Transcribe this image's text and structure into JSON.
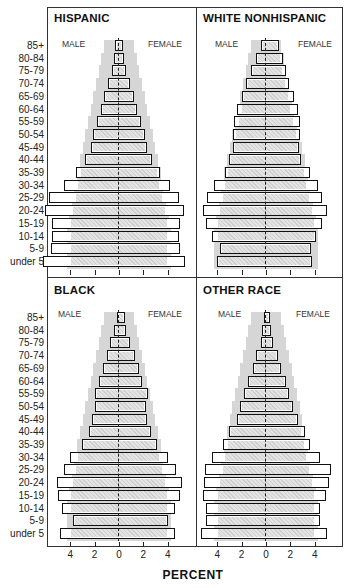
{
  "chart_data": [
    {
      "type": "bar",
      "subtype": "population-pyramid",
      "title": "HISPANIC",
      "categories": [
        "85+",
        "80-84",
        "75-79",
        "70-74",
        "65-69",
        "60-64",
        "55-59",
        "50-54",
        "45-49",
        "40-44",
        "35-39",
        "30-34",
        "25-29",
        "20-24",
        "15-19",
        "10-14",
        "5-9",
        "under 5"
      ],
      "series": [
        {
          "name": "MALE",
          "values": [
            0.3,
            0.4,
            0.6,
            0.9,
            1.2,
            1.5,
            1.8,
            2.1,
            2.3,
            2.8,
            3.5,
            4.5,
            5.7,
            6.1,
            5.5,
            5.5,
            5.6,
            6.2
          ]
        },
        {
          "name": "FEMALE",
          "values": [
            0.3,
            0.4,
            0.6,
            0.9,
            1.2,
            1.5,
            1.8,
            2.1,
            2.3,
            2.7,
            3.4,
            4.2,
            4.9,
            5.3,
            5.0,
            4.9,
            5.0,
            5.4
          ]
        }
      ],
      "xlabel": "PERCENT",
      "xticks": [
        4,
        2,
        0,
        2,
        4
      ]
    },
    {
      "type": "bar",
      "subtype": "population-pyramid",
      "title": "WHITE NONHISPANIC",
      "categories": [
        "85+",
        "80-84",
        "75-79",
        "70-74",
        "65-69",
        "60-64",
        "55-59",
        "50-54",
        "45-49",
        "40-44",
        "35-39",
        "30-34",
        "25-29",
        "20-24",
        "15-19",
        "10-14",
        "5-9",
        "under 5"
      ],
      "series": [
        {
          "name": "MALE",
          "values": [
            0.4,
            0.8,
            1.2,
            1.6,
            2.0,
            2.4,
            2.6,
            2.7,
            2.7,
            3.0,
            3.4,
            4.3,
            4.8,
            5.2,
            4.9,
            4.4,
            3.8,
            4.0
          ]
        },
        {
          "name": "FEMALE",
          "values": [
            1.1,
            1.4,
            1.6,
            1.9,
            2.3,
            2.6,
            2.8,
            2.8,
            2.7,
            2.9,
            3.6,
            4.3,
            4.6,
            5.0,
            4.6,
            4.1,
            3.7,
            3.8
          ]
        }
      ],
      "xlabel": "PERCENT",
      "xticks": [
        4,
        2,
        0,
        2,
        4
      ]
    },
    {
      "type": "bar",
      "subtype": "population-pyramid",
      "title": "BLACK",
      "categories": [
        "85+",
        "80-84",
        "75-79",
        "70-74",
        "65-69",
        "60-64",
        "55-59",
        "50-54",
        "45-49",
        "40-44",
        "35-39",
        "30-34",
        "25-29",
        "20-24",
        "15-19",
        "10-14",
        "5-9",
        "under 5"
      ],
      "series": [
        {
          "name": "MALE",
          "values": [
            0.2,
            0.4,
            0.7,
            1.0,
            1.3,
            1.6,
            2.0,
            2.0,
            2.2,
            2.5,
            3.0,
            4.0,
            4.5,
            5.1,
            5.0,
            4.7,
            3.8,
            4.8
          ]
        },
        {
          "name": "FEMALE",
          "values": [
            0.5,
            0.6,
            0.9,
            1.3,
            1.6,
            1.9,
            2.4,
            2.2,
            2.3,
            2.6,
            3.1,
            4.0,
            4.7,
            5.2,
            5.0,
            4.6,
            4.0,
            4.6
          ]
        }
      ],
      "xlabel": "PERCENT",
      "xticks": [
        4,
        2,
        0,
        2,
        4
      ]
    },
    {
      "type": "bar",
      "subtype": "population-pyramid",
      "title": "OTHER RACE",
      "categories": [
        "85+",
        "80-84",
        "75-79",
        "70-74",
        "65-69",
        "60-64",
        "55-59",
        "50-54",
        "45-49",
        "40-44",
        "35-39",
        "30-34",
        "25-29",
        "20-24",
        "15-19",
        "10-14",
        "5-9",
        "under 5"
      ],
      "series": [
        {
          "name": "MALE",
          "values": [
            0.2,
            0.3,
            0.4,
            0.8,
            1.1,
            1.5,
            1.8,
            2.1,
            2.4,
            3.0,
            3.5,
            4.4,
            5.0,
            5.1,
            5.2,
            4.9,
            4.9,
            5.3
          ]
        },
        {
          "name": "FEMALE",
          "values": [
            0.3,
            0.4,
            0.6,
            1.0,
            1.2,
            1.6,
            1.9,
            2.2,
            2.6,
            3.2,
            3.6,
            4.4,
            5.3,
            5.2,
            4.9,
            4.4,
            4.4,
            5.0
          ]
        }
      ],
      "xlabel": "PERCENT",
      "xticks": [
        4,
        2,
        0,
        2,
        4
      ]
    }
  ],
  "labels": {
    "male": "MALE",
    "female": "FEMALE",
    "xaxis_title": "PERCENT",
    "panels": [
      "HISPANIC",
      "WHITE NONHISPANIC",
      "BLACK",
      "OTHER RACE"
    ]
  },
  "background_reference": {
    "description": "Gray shaded band showing reference (total) population distribution behind each pyramid",
    "color": "#d6d6d6"
  }
}
